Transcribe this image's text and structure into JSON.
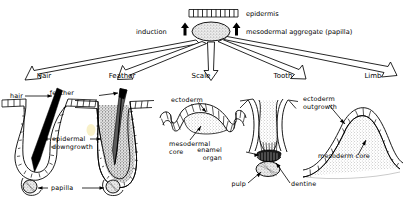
{
  "diagram": {
    "type": "developmental-biology-schematic",
    "title_visible": false,
    "background_color": "#ffffff",
    "ink_color": "#000000",
    "highlight_color": "#f2e49a"
  },
  "top": {
    "epidermis_label": "epidermis",
    "induction_label": "induction",
    "aggregate_label": "mesodermal aggregate (papilla)",
    "epidermis_cell_count": 11,
    "arrow_up_count": 2
  },
  "organs": [
    {
      "id": "hair",
      "label": "Hair"
    },
    {
      "id": "feather",
      "label": "Feather"
    },
    {
      "id": "scale",
      "label": "Scale"
    },
    {
      "id": "tooth",
      "label": "Tooth"
    },
    {
      "id": "limb",
      "label": "Limb"
    }
  ],
  "panels": {
    "hair": {
      "labels": {
        "hair": "hair",
        "downgrowth_line1": "epidermal",
        "downgrowth_line2": "downgrowth"
      }
    },
    "feather": {
      "labels": {
        "feather": "feather"
      }
    },
    "shared": {
      "papilla": "papilla"
    },
    "scale": {
      "labels": {
        "ectoderm": "ectoderm",
        "core_line1": "mesodermal",
        "core_line2": "core"
      }
    },
    "tooth": {
      "labels": {
        "enamel_line1": "enamel",
        "enamel_line2": "organ",
        "pulp": "pulp",
        "dentine": "dentine"
      }
    },
    "limb": {
      "labels": {
        "ectoderm_line1": "ectoderm",
        "ectoderm_line2": "outgrowth",
        "mesoderm": "mesoderm core"
      }
    }
  }
}
